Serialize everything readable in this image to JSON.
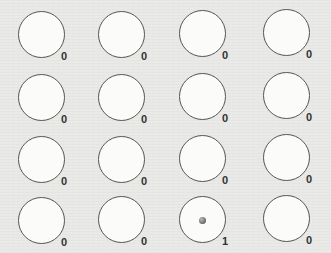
{
  "grid": {
    "rows": 4,
    "cols": 4,
    "cells": [
      {
        "row": 0,
        "col": 0,
        "count": "0",
        "has_item": false
      },
      {
        "row": 0,
        "col": 1,
        "count": "0",
        "has_item": false
      },
      {
        "row": 0,
        "col": 2,
        "count": "0",
        "has_item": false
      },
      {
        "row": 0,
        "col": 3,
        "count": "0",
        "has_item": false
      },
      {
        "row": 1,
        "col": 0,
        "count": "0",
        "has_item": false
      },
      {
        "row": 1,
        "col": 1,
        "count": "0",
        "has_item": false
      },
      {
        "row": 1,
        "col": 2,
        "count": "0",
        "has_item": false
      },
      {
        "row": 1,
        "col": 3,
        "count": "0",
        "has_item": false
      },
      {
        "row": 2,
        "col": 0,
        "count": "0",
        "has_item": false
      },
      {
        "row": 2,
        "col": 1,
        "count": "0",
        "has_item": false
      },
      {
        "row": 2,
        "col": 2,
        "count": "0",
        "has_item": false
      },
      {
        "row": 2,
        "col": 3,
        "count": "0",
        "has_item": false
      },
      {
        "row": 3,
        "col": 0,
        "count": "0",
        "has_item": false
      },
      {
        "row": 3,
        "col": 1,
        "count": "0",
        "has_item": false
      },
      {
        "row": 3,
        "col": 2,
        "count": "1",
        "has_item": true
      },
      {
        "row": 3,
        "col": 3,
        "count": "0",
        "has_item": false
      }
    ]
  },
  "colors": {
    "background": "#e9e9e7",
    "circle_outline": "#555555",
    "circle_fill": "#fbfbfa",
    "label": "#333333"
  }
}
